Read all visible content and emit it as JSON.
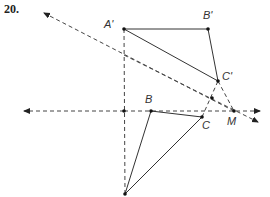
{
  "problem_number": "20.",
  "labels": {
    "A_prime": "A'",
    "B_prime": "B'",
    "C_prime": "C'",
    "B": "B",
    "C": "C",
    "M": "M"
  },
  "points": {
    "A_prime": [
      124,
      29
    ],
    "B_prime": [
      208,
      29
    ],
    "C_prime": [
      218,
      81
    ],
    "A": [
      125,
      194
    ],
    "B": [
      151,
      111
    ],
    "C": [
      202,
      117
    ],
    "M": [
      234,
      111
    ],
    "intersect_vertical_horizontal": [
      124,
      111
    ],
    "intersect_CpM_line": [
      212,
      98
    ]
  },
  "colors": {
    "line": "#333333",
    "dashed": "#444444",
    "point": "#111111"
  }
}
